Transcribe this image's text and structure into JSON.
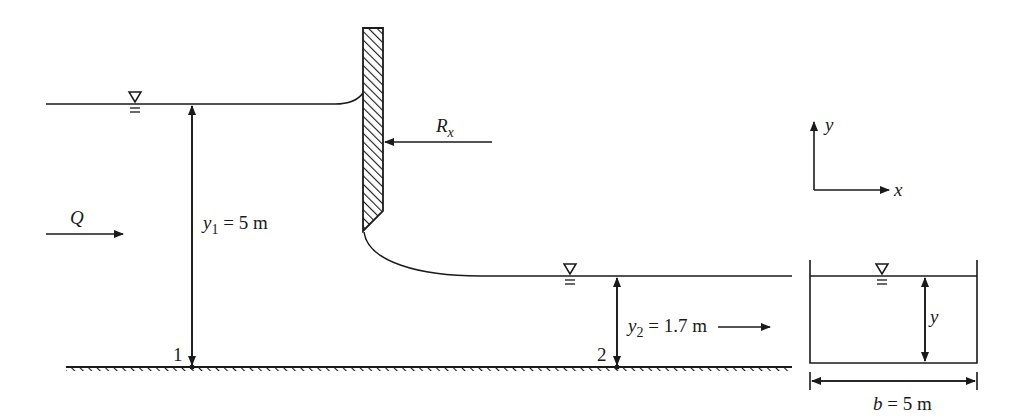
{
  "figure": {
    "type": "sluice-gate flow diagram",
    "labels": {
      "flow": "Q",
      "force": "R",
      "force_sub": "x",
      "y1_var": "y",
      "y1_sub": "1",
      "y1_value": " = 5 m",
      "y2_var": "y",
      "y2_sub": "2",
      "y2_value": " = 1.7 m",
      "section1": "1",
      "section2": "2",
      "axis_x": "x",
      "axis_y": "y",
      "cross_depth": "y",
      "width_var": "b",
      "width_value": " = 5 m"
    },
    "quantities": {
      "upstream_depth_m": 5,
      "downstream_depth_m": 1.7,
      "channel_width_m": 5
    },
    "colors": {
      "ink": "#1a1a1a",
      "background": "#ffffff"
    }
  }
}
